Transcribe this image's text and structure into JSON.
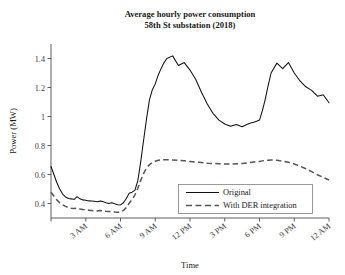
{
  "chart_data": {
    "type": "line",
    "title": "Average hourly power consumption",
    "subtitle": "58th St substation (2018)",
    "xlabel": "Time",
    "ylabel": "Power (MW)",
    "xlim": [
      0,
      24
    ],
    "ylim": [
      0.3,
      1.5
    ],
    "grid": false,
    "legend_position": "lower center",
    "xtick_values": [
      0,
      3,
      6,
      9,
      12,
      15,
      18,
      21,
      24
    ],
    "xtick_labels": [
      "",
      "3 AM",
      "6 AM",
      "9 AM",
      "12 PM",
      "3 PM",
      "6 PM",
      "9 PM",
      "12 AM"
    ],
    "ytick_values": [
      0.4,
      0.6,
      0.8,
      1.0,
      1.2,
      1.4
    ],
    "ytick_labels": [
      "0.4",
      "0.6",
      "0.8",
      "1",
      "1.2",
      "1.4"
    ],
    "x": [
      0,
      0.25,
      0.5,
      0.75,
      1,
      1.25,
      1.5,
      1.75,
      2,
      2.25,
      2.5,
      2.75,
      3,
      3.25,
      3.5,
      3.75,
      4,
      4.25,
      4.5,
      4.75,
      5,
      5.25,
      5.5,
      5.75,
      6,
      6.25,
      6.5,
      6.75,
      7,
      7.25,
      7.5,
      7.75,
      8,
      8.25,
      8.5,
      8.75,
      9,
      9.25,
      9.5,
      9.75,
      10,
      10.5,
      11,
      11.5,
      12,
      12.5,
      13,
      13.5,
      14,
      14.5,
      15,
      15.5,
      16,
      16.5,
      17,
      17.25,
      17.5,
      17.75,
      18,
      18.25,
      18.5,
      18.75,
      19,
      19.5,
      20,
      20.5,
      21,
      21.5,
      22,
      22.5,
      23,
      23.5,
      24
    ],
    "series": [
      {
        "name": "Original",
        "style": "solid",
        "color": "#111111",
        "values": [
          0.655,
          0.6,
          0.545,
          0.5,
          0.465,
          0.445,
          0.435,
          0.432,
          0.428,
          0.447,
          0.432,
          0.425,
          0.423,
          0.418,
          0.417,
          0.415,
          0.412,
          0.418,
          0.413,
          0.405,
          0.4,
          0.405,
          0.398,
          0.392,
          0.39,
          0.405,
          0.435,
          0.47,
          0.478,
          0.492,
          0.56,
          0.69,
          0.84,
          0.985,
          1.115,
          1.185,
          1.225,
          1.285,
          1.33,
          1.37,
          1.4,
          1.418,
          1.352,
          1.372,
          1.32,
          1.255,
          1.165,
          1.085,
          1.02,
          0.975,
          0.948,
          0.932,
          0.945,
          0.93,
          0.948,
          0.955,
          0.96,
          0.968,
          0.975,
          1.04,
          1.12,
          1.215,
          1.3,
          1.368,
          1.33,
          1.372,
          1.3,
          1.245,
          1.205,
          1.18,
          1.14,
          1.15,
          1.095
        ],
        "note_peaks": {
          "morning_peak": 1.42,
          "evening_peak": 1.37
        }
      },
      {
        "name": "With DER integration",
        "style": "dashed",
        "color": "#555555",
        "values": [
          0.478,
          0.452,
          0.425,
          0.405,
          0.392,
          0.38,
          0.372,
          0.368,
          0.365,
          0.368,
          0.362,
          0.358,
          0.356,
          0.354,
          0.352,
          0.35,
          0.348,
          0.352,
          0.35,
          0.346,
          0.344,
          0.346,
          0.342,
          0.34,
          0.34,
          0.352,
          0.372,
          0.402,
          0.428,
          0.46,
          0.505,
          0.56,
          0.608,
          0.645,
          0.668,
          0.682,
          0.692,
          0.698,
          0.7,
          0.702,
          0.702,
          0.7,
          0.697,
          0.694,
          0.69,
          0.686,
          0.682,
          0.678,
          0.676,
          0.674,
          0.672,
          0.672,
          0.674,
          0.676,
          0.68,
          0.683,
          0.686,
          0.688,
          0.69,
          0.694,
          0.697,
          0.699,
          0.7,
          0.698,
          0.692,
          0.684,
          0.672,
          0.658,
          0.64,
          0.62,
          0.598,
          0.58,
          0.562
        ]
      }
    ]
  },
  "legend": {
    "entries": [
      {
        "label": "Original",
        "style": "solid"
      },
      {
        "label": "With DER integration",
        "style": "dashed"
      }
    ]
  }
}
